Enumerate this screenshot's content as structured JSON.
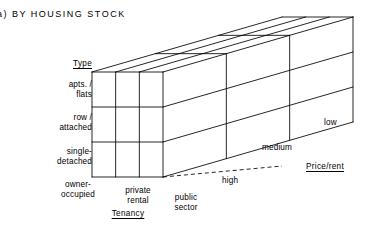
{
  "figure": {
    "caption": "a)  BY HOUSING STOCK"
  },
  "axes": {
    "vertical": {
      "title": "Type",
      "title_pos": {
        "x": 30,
        "y": 59
      },
      "categories": [
        {
          "label": "apts. /\nflats",
          "pos": {
            "x": 14,
            "y": 80
          }
        },
        {
          "label": "row /\nattached",
          "pos": {
            "x": 14,
            "y": 113
          }
        },
        {
          "label": "single-\ndetached",
          "pos": {
            "x": 14,
            "y": 147
          }
        }
      ]
    },
    "horizontal": {
      "title": "Tenancy",
      "title_pos": {
        "x": 100,
        "y": 209
      },
      "categories": [
        {
          "label": "owner-\noccupied",
          "pos": {
            "x": 52,
            "y": 180
          }
        },
        {
          "label": "private\nrental",
          "pos": {
            "x": 112,
            "y": 186
          }
        },
        {
          "label": "public\nsector",
          "pos": {
            "x": 160,
            "y": 193
          }
        }
      ]
    },
    "depth": {
      "title": "Price/rent",
      "title_pos": {
        "x": 306,
        "y": 162
      },
      "categories": [
        {
          "label": "high",
          "pos": {
            "x": 222,
            "y": 176
          }
        },
        {
          "label": "medium",
          "pos": {
            "x": 262,
            "y": 143
          }
        },
        {
          "label": "low",
          "pos": {
            "x": 324,
            "y": 118
          }
        }
      ]
    }
  },
  "cube": {
    "description": "3 x 3 x 3 classification cube drawn in oblique projection",
    "divisions": 3,
    "stroke_color": "#000000",
    "fill_color": "#ffffff",
    "front_face": {
      "left": 92,
      "top": 72,
      "right": 163,
      "bottom": 177
    },
    "depth_offset": {
      "dx": 190,
      "dy": -55
    },
    "guide_line": {
      "style": "dashed",
      "from": {
        "x": 163,
        "y": 177
      },
      "to": {
        "x": 282,
        "y": 166
      }
    }
  }
}
